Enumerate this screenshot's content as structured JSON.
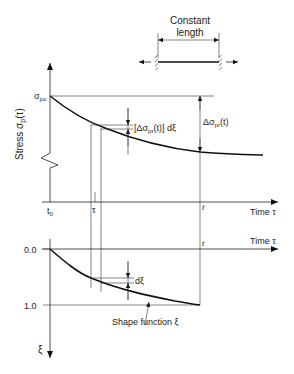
{
  "diagram": {
    "inset": {
      "label_line1": "Constant",
      "label_line2": "length"
    },
    "upper_plot": {
      "y_axis_label": "Stress σ",
      "y_axis_label_sub": "p",
      "y_axis_label_arg": "(τ)",
      "initial_value_label": "σ",
      "initial_value_sub": "po",
      "delta_increment_label_pre": "[Δσ",
      "delta_increment_label_sub": "pr",
      "delta_increment_label_post": "(t)] dξ",
      "delta_total_label_pre": "Δσ",
      "delta_total_label_sub": "pr",
      "delta_total_label_post": "(t)",
      "x_axis_label": "Time τ",
      "tick_t0": "t",
      "tick_t0_sub": "0",
      "tick_tau": "τ",
      "tick_t": "t"
    },
    "lower_plot": {
      "x_axis_label": "Time τ",
      "tick_t": "t",
      "y_tick_0": "0.0",
      "y_tick_1": "1.0",
      "y_axis_label": "ξ",
      "increment_label": "dξ",
      "curve_label": "Shape function ξ"
    }
  }
}
